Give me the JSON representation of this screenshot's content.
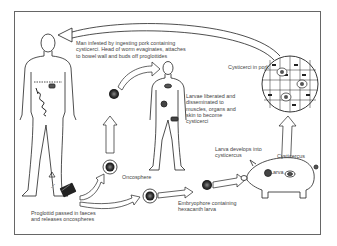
{
  "diagram": {
    "labels": {
      "man_infested": "Man infested by ingesting pork containing\ncysticerci. Head of worm evaginates, attaches\nto bowel wall and buds off proglottides",
      "cysticerci_in_pork": "Cysticerci in pork",
      "larvae_liberated": "Larvae liberated and\ndisseminated to\nmuscles, organs and\nskin to become\ncysticerci",
      "larva_develops": "Larva develops into\ncysticercus",
      "cysticercus": "Cysticercus",
      "larva": "Larva",
      "oncosphere": "Oncosphere",
      "embryophore": "Embryophore containing\nhexacanth larva",
      "proglottid_passed": "Proglottid passed in faeces\nand releases oncospheres"
    },
    "nodes": [
      {
        "id": "human-host",
        "type": "figure"
      },
      {
        "id": "proglottid",
        "type": "stage"
      },
      {
        "id": "oncosphere",
        "type": "stage"
      },
      {
        "id": "embryophore",
        "type": "stage"
      },
      {
        "id": "pig-host",
        "type": "figure"
      },
      {
        "id": "cysticerci-in-pork",
        "type": "magnified-view"
      },
      {
        "id": "human-cysticercosis",
        "type": "figure"
      }
    ],
    "edges": [
      {
        "from": "cysticerci-in-pork",
        "to": "human-host"
      },
      {
        "from": "proglottid",
        "to": "oncosphere"
      },
      {
        "from": "proglottid",
        "to": "embryophore"
      },
      {
        "from": "embryophore",
        "to": "pig-host"
      },
      {
        "from": "pig-host",
        "to": "cysticerci-in-pork"
      },
      {
        "from": "oncosphere",
        "to": "human-cysticercosis"
      }
    ],
    "colors": {
      "line": "#222222",
      "text": "#444444",
      "frame": "#666666",
      "background": "#ffffff"
    }
  }
}
